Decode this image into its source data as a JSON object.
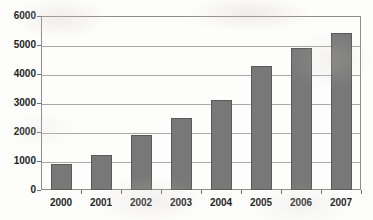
{
  "chart_data": {
    "type": "bar",
    "title": "",
    "xlabel": "",
    "ylabel": "",
    "categories": [
      "2000",
      "2001",
      "2002",
      "2003",
      "2004",
      "2005",
      "2006",
      "2007"
    ],
    "values": [
      880,
      1200,
      1900,
      2480,
      3090,
      4280,
      4880,
      5430
    ],
    "series": [
      {
        "name": "",
        "values": [
          880,
          1200,
          1900,
          2480,
          3090,
          4280,
          4880,
          5430
        ]
      }
    ],
    "ylim": [
      0,
      6000
    ],
    "ytick_labels": [
      "0",
      "1000",
      "2000",
      "3000",
      "4000",
      "5000",
      "6000"
    ],
    "yticks": [
      0,
      1000,
      2000,
      3000,
      4000,
      5000,
      6000
    ],
    "grid": true,
    "grid_axis": "y",
    "legend": false,
    "legend_position": "none",
    "colors": {
      "bar_fill": "#787878",
      "bar_border": "#5a5a5a",
      "gridline": "#a8a8a8",
      "axis": "#8e8e8e",
      "text": "#1d1d1d",
      "background": "#fdfdfc"
    }
  }
}
